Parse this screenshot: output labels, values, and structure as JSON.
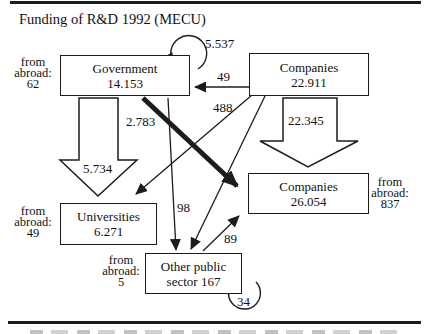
{
  "diagram": {
    "title": "Funding of R&D 1992 (MECU)",
    "nodes": {
      "government": {
        "label": "Government",
        "value": "14.153",
        "from_abroad": {
          "line1": "from",
          "line2": "abroad:",
          "value": "62"
        }
      },
      "companies_funding": {
        "label": "Companies",
        "value": "22.911"
      },
      "universities": {
        "label": "Universities",
        "value": "6.271",
        "from_abroad": {
          "line1": "from",
          "line2": "abroad:",
          "value": "49"
        }
      },
      "companies_performing": {
        "label": "Companies",
        "value": "26.054",
        "from_abroad": {
          "line1": "from",
          "line2": "abroad:",
          "value": "837"
        }
      },
      "other_public": {
        "label_line1": "Other public",
        "label_line2": "sector 167",
        "from_abroad": {
          "line1": "from",
          "line2": "abroad:",
          "value": "5"
        }
      }
    },
    "flows": {
      "government_self": "5.537",
      "companies_to_government": "49",
      "companies_to_universities": "488",
      "government_to_companies": "2.783",
      "government_to_universities": "5.734",
      "companies_to_companies": "22.345",
      "government_to_other_public": "98",
      "other_public_to_companies": "89",
      "other_public_self": "34"
    }
  }
}
